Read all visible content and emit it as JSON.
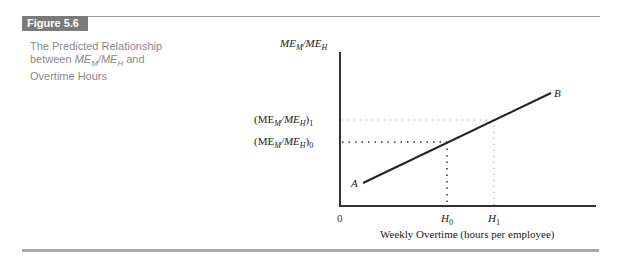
{
  "figure": {
    "label": "Figure 5.6",
    "caption_line1": "The Predicted Relationship",
    "caption_line2_pre": "between ",
    "caption_me_m": "ME",
    "caption_sub_m": "M",
    "caption_slash": "/",
    "caption_me_h": "ME",
    "caption_sub_h": "H",
    "caption_line2_post": " and",
    "caption_line3": "Overtime Hours"
  },
  "diagram": {
    "y_axis_label_main": "ME",
    "y_axis_label_sub_m": "M",
    "y_axis_label_slash": "/ME",
    "y_axis_label_sub_h": "H",
    "x_axis_label": "Weekly Overtime (hours per employee)",
    "origin_label": "0",
    "level1_label": "(ME",
    "level1_label_sub_m": "M",
    "level1_label_mid": "/ME",
    "level1_label_sub_h": "H",
    "level1_label_close": ")",
    "level1_index": "1",
    "level0_index": "0",
    "h0_label": "H",
    "h0_sub": "0",
    "h1_label": "H",
    "h1_sub": "1",
    "point_a": "A",
    "point_b": "B"
  },
  "colors": {
    "badge_bg": "#7b7b7b",
    "caption_text": "#8a8a8a",
    "line": "#222222"
  }
}
